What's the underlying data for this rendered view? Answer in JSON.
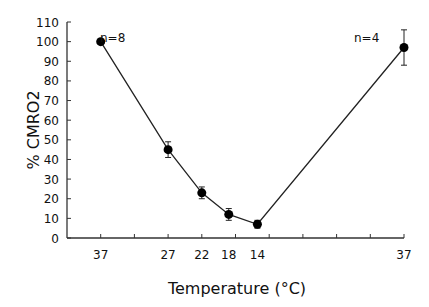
{
  "chart_data": {
    "type": "line",
    "title": "",
    "xlabel": "Temperature (°C)",
    "ylabel": "% CMRO2",
    "ylim": [
      0,
      110
    ],
    "yticks": [
      0,
      10,
      20,
      30,
      40,
      50,
      60,
      70,
      80,
      90,
      100,
      110
    ],
    "xtick_labels": [
      "37",
      "27",
      "22",
      "18",
      "14",
      "37"
    ],
    "grid": false,
    "series": [
      {
        "name": "CMRO2",
        "x": [
          "37",
          "27",
          "22",
          "18",
          "14",
          "37"
        ],
        "values": [
          100,
          45,
          23,
          12,
          7,
          97
        ],
        "error": [
          0,
          4,
          3,
          3,
          2,
          9
        ]
      }
    ],
    "annotations": [
      {
        "text": "n=8",
        "near": "first point"
      },
      {
        "text": "n=4",
        "near": "last point"
      }
    ]
  },
  "labels": {
    "xlabel": "Temperature (°C)",
    "ylabel": "% CMRO2",
    "n_left": "n=8",
    "n_right": "n=4"
  }
}
